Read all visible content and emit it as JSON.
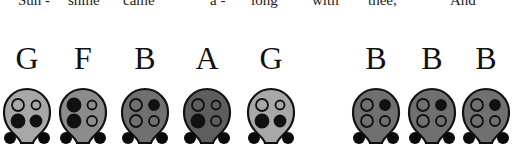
{
  "lyrics": [
    {
      "text": "Sun -",
      "x": 18
    },
    {
      "text": "shine",
      "x": 68
    },
    {
      "text": "came",
      "x": 123
    },
    {
      "text": "a -",
      "x": 210
    },
    {
      "text": "long",
      "x": 251
    },
    {
      "text": "with",
      "x": 312
    },
    {
      "text": "thee,",
      "x": 368
    },
    {
      "text": "And",
      "x": 450
    }
  ],
  "notes": [
    {
      "letter": "G",
      "cx": 27,
      "body": "#a8a8a8",
      "holes": [
        false,
        false,
        true,
        true
      ]
    },
    {
      "letter": "F",
      "cx": 83,
      "body": "#8c8c8c",
      "holes": [
        true,
        false,
        true,
        false
      ]
    },
    {
      "letter": "B",
      "cx": 145,
      "body": "#707070",
      "holes": [
        false,
        true,
        false,
        false
      ]
    },
    {
      "letter": "A",
      "cx": 207,
      "body": "#5e5e5e",
      "holes": [
        false,
        false,
        true,
        false
      ]
    },
    {
      "letter": "G",
      "cx": 271,
      "body": "#a8a8a8",
      "holes": [
        false,
        false,
        true,
        true
      ]
    },
    {
      "letter": "B",
      "cx": 376,
      "body": "#707070",
      "holes": [
        false,
        true,
        false,
        false
      ]
    },
    {
      "letter": "B",
      "cx": 432,
      "body": "#707070",
      "holes": [
        false,
        true,
        false,
        false
      ]
    },
    {
      "letter": "B",
      "cx": 486,
      "body": "#707070",
      "holes": [
        false,
        true,
        false,
        false
      ]
    }
  ]
}
